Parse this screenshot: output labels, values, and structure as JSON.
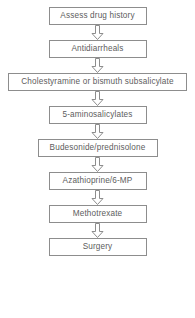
{
  "diagram": {
    "type": "vertical-flowchart",
    "background_color": "#ffffff",
    "border_color": "#8d8d8d",
    "text_color": "#5d5d5d",
    "arrow_icon_name": "arrow-down-hollow-icon",
    "nodes": [
      {
        "id": "step-1",
        "label": "Assess drug history",
        "width": "narrow"
      },
      {
        "id": "step-2",
        "label": "Antidiarrheals",
        "width": "narrow"
      },
      {
        "id": "step-3",
        "label": "Cholestyramine or bismuth subsalicylate",
        "width": "wide"
      },
      {
        "id": "step-4",
        "label": "5-aminosalicylates",
        "width": "narrow"
      },
      {
        "id": "step-5",
        "label": "Budesonide/prednisolone",
        "width": "medium"
      },
      {
        "id": "step-6",
        "label": "Azathioprine/6-MP",
        "width": "narrow"
      },
      {
        "id": "step-7",
        "label": "Methotrexate",
        "width": "narrow"
      },
      {
        "id": "step-8",
        "label": "Surgery",
        "width": "narrow"
      }
    ],
    "connectors": [
      {
        "from": "step-1",
        "to": "step-2",
        "direction": "down"
      },
      {
        "from": "step-2",
        "to": "step-3",
        "direction": "down"
      },
      {
        "from": "step-3",
        "to": "step-4",
        "direction": "down"
      },
      {
        "from": "step-4",
        "to": "step-5",
        "direction": "down"
      },
      {
        "from": "step-5",
        "to": "step-6",
        "direction": "down"
      },
      {
        "from": "step-6",
        "to": "step-7",
        "direction": "down"
      },
      {
        "from": "step-7",
        "to": "step-8",
        "direction": "down"
      }
    ]
  }
}
